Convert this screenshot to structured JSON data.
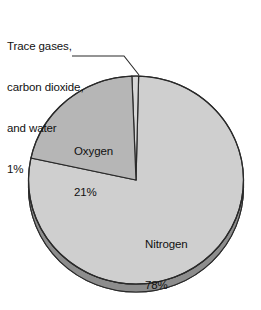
{
  "chart_data": {
    "type": "pie",
    "title": "",
    "subtitle": "",
    "xlabel": "",
    "ylabel": "",
    "legend_position": "none",
    "grid": false,
    "three_d": true,
    "categories": [
      "Nitrogen",
      "Oxygen",
      "Trace gases, carbon dioxide, and water"
    ],
    "values": [
      78,
      21,
      1
    ],
    "units": "%",
    "slices": [
      {
        "name": "Nitrogen",
        "value": 78,
        "value_label": "78%",
        "label_placement": "inside",
        "color": "#cfcfcf"
      },
      {
        "name": "Oxygen",
        "value": 21,
        "value_label": "21%",
        "label_placement": "inside",
        "color": "#b6b6b6"
      },
      {
        "name": "Trace gases, carbon dioxide, and water",
        "value": 1,
        "value_label": "1%",
        "label_placement": "callout",
        "color": "#d6d6d6"
      }
    ],
    "annotations": [
      {
        "text": "Trace gases, carbon dioxide, and water 1%",
        "leader_line": true,
        "points_to": "Trace gases, carbon dioxide, and water"
      }
    ]
  },
  "callout": {
    "line1": "Trace gases,",
    "line2": "carbon dioxide,",
    "line3": "and water",
    "line4": "1%"
  },
  "labels": {
    "oxygen_name": "Oxygen",
    "oxygen_value": "21%",
    "nitrogen_name": "Nitrogen",
    "nitrogen_value": "78%"
  },
  "colors": {
    "nitrogen_slice": "#cfcfcf",
    "oxygen_slice": "#b6b6b6",
    "trace_slice": "#d6d6d6",
    "side_wall": "#9a9a9a",
    "outline": "#2a2a2a",
    "background": "#ffffff",
    "text": "#111111"
  }
}
